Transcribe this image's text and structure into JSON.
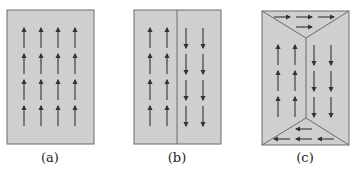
{
  "figure": {
    "colors": {
      "fill": "#cfcfcf",
      "stroke": "#6a6a6a",
      "arrow": "#333333",
      "background": "#ffffff"
    },
    "panels": [
      {
        "id": "a",
        "label": "(a)",
        "description": "single domain, all moments pointing up",
        "box": {
          "x": 7,
          "y": 10,
          "w": 87,
          "h": 134
        },
        "arrows_up_columns_x": [
          24,
          41,
          58,
          75
        ],
        "arrow_rows_y": [
          28,
          54,
          80,
          106
        ]
      },
      {
        "id": "b",
        "label": "(b)",
        "description": "two domains separated by a wall: left up, right down",
        "box": {
          "x": 134,
          "y": 10,
          "w": 87,
          "h": 134
        },
        "divider_x": 177,
        "arrows_up_columns_x": [
          150,
          167
        ],
        "arrows_down_columns_x": [
          186,
          203
        ],
        "arrow_rows_y": [
          28,
          54,
          80,
          106
        ]
      },
      {
        "id": "c",
        "label": "(c)",
        "description": "flux-closure domains: side domains up/down, triangular closure domains right (top) and left (bottom)",
        "box": {
          "x": 262,
          "y": 11,
          "w": 87,
          "h": 134
        },
        "top_apex": {
          "x": 306,
          "y": 38
        },
        "bottom_apex": {
          "x": 306,
          "y": 118
        },
        "arrows_up_columns_x": [
          278,
          295
        ],
        "arrows_down_columns_x": [
          314,
          331
        ],
        "arrow_rows_y": [
          45,
          71,
          97
        ],
        "top_right_arrows": [
          {
            "x": 282,
            "y": 17
          },
          {
            "x": 304,
            "y": 17
          },
          {
            "x": 326,
            "y": 17
          },
          {
            "x": 304,
            "y": 27
          }
        ],
        "bottom_left_arrows": [
          {
            "x": 304,
            "y": 129
          },
          {
            "x": 282,
            "y": 139
          },
          {
            "x": 304,
            "y": 139
          },
          {
            "x": 326,
            "y": 139
          }
        ]
      }
    ]
  }
}
